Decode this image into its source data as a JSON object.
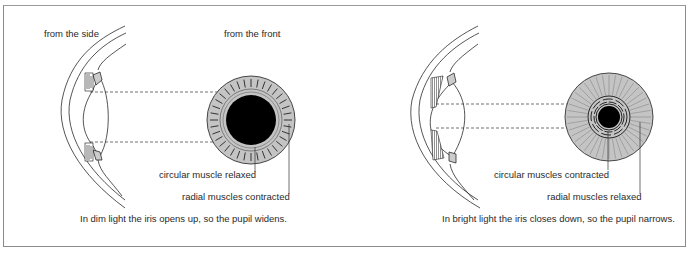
{
  "panels": [
    {
      "id": "dim",
      "view_side_label": "from the side",
      "view_front_label": "from the front",
      "callout_circular": "circular muscle relaxed",
      "callout_radial": "radial muscles contracted",
      "caption": "In dim light the iris opens up, so the pupil widens.",
      "pupil_state": "wide"
    },
    {
      "id": "bright",
      "callout_circular": "circular muscles contracted",
      "callout_radial": "radial muscles relaxed",
      "caption": "In bright light the iris closes down, so the pupil narrows.",
      "pupil_state": "narrow"
    }
  ],
  "colors": {
    "iris_fill": "#c4c4c4",
    "pupil": "#000000",
    "line": "#2a2a2a",
    "frame": "#8a8a8a"
  }
}
